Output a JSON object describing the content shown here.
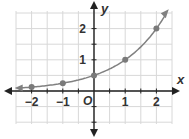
{
  "chart_data": {
    "type": "line",
    "title": "",
    "xlabel": "x",
    "ylabel": "y",
    "origin_label": "O",
    "x_ticks": [
      "-2",
      "-1",
      "1",
      "2"
    ],
    "y_ticks": [
      "1",
      "2"
    ],
    "xlim": [
      -2.5,
      2.5
    ],
    "ylim": [
      -1.1,
      2.6
    ],
    "grid": true,
    "grid_step": 0.5,
    "function": "y = 0.5 * 2^x",
    "series": [
      {
        "name": "exponential curve",
        "x": [
          -2,
          -1,
          0,
          1,
          2
        ],
        "y": [
          0.125,
          0.25,
          0.5,
          1,
          2
        ]
      }
    ],
    "colors": {
      "grid": "#d8d8d8",
      "axis": "#222222",
      "curve": "#808080",
      "points": "#7a7a7a"
    }
  }
}
